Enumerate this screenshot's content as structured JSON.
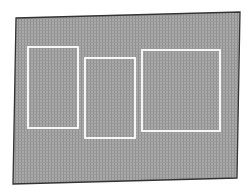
{
  "diagram": {
    "background": "#ffffff",
    "sheet": {
      "fill": "#a9a9a9",
      "hatch": "#8f8f8f",
      "stroke": "#333333",
      "corners": [
        [
          16,
          18
        ],
        [
          240,
          12
        ],
        [
          237,
          178
        ],
        [
          13,
          184
        ]
      ]
    },
    "rectangles": [
      {
        "id": "left",
        "x": 28,
        "y": 47,
        "w": 50,
        "h": 81,
        "stroke": "#ffffff"
      },
      {
        "id": "middle",
        "x": 85,
        "y": 58,
        "w": 50,
        "h": 80,
        "stroke": "#ffffff"
      },
      {
        "id": "right",
        "x": 142,
        "y": 50,
        "w": 78,
        "h": 81,
        "stroke": "#ffffff"
      }
    ]
  }
}
